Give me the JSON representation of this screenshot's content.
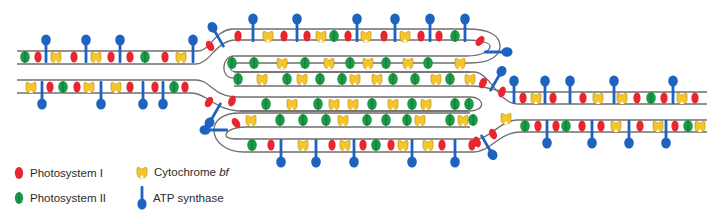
{
  "figure": {
    "colors": {
      "membrane": "#6f6f6f",
      "photosystem_i": "#e8262f",
      "photosystem_ii": "#1c9a47",
      "cytochrome_bf": "#f5c52c",
      "atp_synthase": "#1e63c0"
    }
  },
  "legend": {
    "items": [
      {
        "key": "photosystem_i",
        "icon": "red-oval-icon",
        "label": "Photosystem I",
        "label_italic": ""
      },
      {
        "key": "cytochrome_bf",
        "icon": "yellow-cup-icon",
        "label": "Cytochrome ",
        "label_italic": "bf"
      },
      {
        "key": "photosystem_ii",
        "icon": "green-oval-icon",
        "label": "Photosystem II",
        "label_italic": ""
      },
      {
        "key": "atp_synthase",
        "icon": "blue-lollipop-icon",
        "label": "ATP synthase",
        "label_italic": ""
      }
    ]
  },
  "proteins": {
    "left_top_band": [
      {
        "type": "PSII",
        "x": 25,
        "y": 57
      },
      {
        "type": "PSI",
        "x": 38,
        "y": 57
      },
      {
        "type": "ATP",
        "x": 46,
        "y": 57,
        "dir": "up"
      },
      {
        "type": "CYT",
        "x": 56,
        "y": 57
      },
      {
        "type": "PSI",
        "x": 74,
        "y": 57
      },
      {
        "type": "ATP",
        "x": 86,
        "y": 57,
        "dir": "up"
      },
      {
        "type": "CYT",
        "x": 96,
        "y": 57
      },
      {
        "type": "PSI",
        "x": 111,
        "y": 57
      },
      {
        "type": "ATP",
        "x": 120,
        "y": 57,
        "dir": "up"
      },
      {
        "type": "PSI",
        "x": 130,
        "y": 57
      },
      {
        "type": "PSII",
        "x": 145,
        "y": 57
      },
      {
        "type": "PSI",
        "x": 165,
        "y": 57
      },
      {
        "type": "CYT",
        "x": 181,
        "y": 57
      },
      {
        "type": "ATP",
        "x": 193,
        "y": 57,
        "dir": "up"
      }
    ],
    "left_bottom_band": [
      {
        "type": "CYT",
        "x": 31,
        "y": 87
      },
      {
        "type": "ATP",
        "x": 42,
        "y": 87,
        "dir": "down"
      },
      {
        "type": "PSI",
        "x": 50,
        "y": 87
      },
      {
        "type": "PSII",
        "x": 63,
        "y": 87
      },
      {
        "type": "PSI",
        "x": 77,
        "y": 87
      },
      {
        "type": "CYT",
        "x": 89,
        "y": 87
      },
      {
        "type": "ATP",
        "x": 101,
        "y": 87,
        "dir": "down"
      },
      {
        "type": "CYT",
        "x": 116,
        "y": 87
      },
      {
        "type": "PSI",
        "x": 130,
        "y": 87
      },
      {
        "type": "ATP",
        "x": 143,
        "y": 87,
        "dir": "down"
      },
      {
        "type": "PSI",
        "x": 155,
        "y": 87
      },
      {
        "type": "ATP",
        "x": 163,
        "y": 87,
        "dir": "down"
      },
      {
        "type": "PSII",
        "x": 174,
        "y": 87
      },
      {
        "type": "PSI",
        "x": 185,
        "y": 87
      }
    ],
    "grana_top_outer": [
      {
        "type": "PSI",
        "x": 238,
        "y": 36
      },
      {
        "type": "ATP",
        "x": 253,
        "y": 36,
        "dir": "up"
      },
      {
        "type": "CYT",
        "x": 268,
        "y": 36
      },
      {
        "type": "PSI",
        "x": 284,
        "y": 36
      },
      {
        "type": "ATP",
        "x": 297,
        "y": 36,
        "dir": "up"
      },
      {
        "type": "PSI",
        "x": 307,
        "y": 36
      },
      {
        "type": "CYT",
        "x": 321,
        "y": 36
      },
      {
        "type": "PSII",
        "x": 334,
        "y": 36
      },
      {
        "type": "PSI",
        "x": 348,
        "y": 36
      },
      {
        "type": "ATP",
        "x": 357,
        "y": 36,
        "dir": "up"
      },
      {
        "type": "CYT",
        "x": 366,
        "y": 36
      },
      {
        "type": "PSI",
        "x": 384,
        "y": 36
      },
      {
        "type": "ATP",
        "x": 395,
        "y": 36,
        "dir": "up"
      },
      {
        "type": "CYT",
        "x": 405,
        "y": 36
      },
      {
        "type": "PSI",
        "x": 421,
        "y": 36
      },
      {
        "type": "ATP",
        "x": 430,
        "y": 36,
        "dir": "up"
      },
      {
        "type": "PSI",
        "x": 439,
        "y": 36
      },
      {
        "type": "PSII",
        "x": 455,
        "y": 36
      },
      {
        "type": "ATP",
        "x": 465,
        "y": 36,
        "dir": "up"
      }
    ],
    "grana_row1": [
      {
        "type": "PSII",
        "x": 232,
        "y": 63
      },
      {
        "type": "PSII",
        "x": 254,
        "y": 63
      },
      {
        "type": "CYT",
        "x": 282,
        "y": 63
      },
      {
        "type": "PSII",
        "x": 305,
        "y": 63
      },
      {
        "type": "CYT",
        "x": 329,
        "y": 63
      },
      {
        "type": "PSII",
        "x": 350,
        "y": 63
      },
      {
        "type": "CYT",
        "x": 368,
        "y": 63
      },
      {
        "type": "PSII",
        "x": 386,
        "y": 63
      },
      {
        "type": "CYT",
        "x": 408,
        "y": 63
      },
      {
        "type": "PSII",
        "x": 428,
        "y": 63
      },
      {
        "type": "CYT",
        "x": 460,
        "y": 63
      }
    ],
    "grana_row2": [
      {
        "type": "PSII",
        "x": 238,
        "y": 79
      },
      {
        "type": "CYT",
        "x": 262,
        "y": 79
      },
      {
        "type": "PSII",
        "x": 287,
        "y": 79
      },
      {
        "type": "CYT",
        "x": 302,
        "y": 79
      },
      {
        "type": "PSII",
        "x": 320,
        "y": 79
      },
      {
        "type": "PSII",
        "x": 342,
        "y": 79
      },
      {
        "type": "CYT",
        "x": 355,
        "y": 79
      },
      {
        "type": "CYT",
        "x": 377,
        "y": 79
      },
      {
        "type": "PSII",
        "x": 393,
        "y": 79
      },
      {
        "type": "PSII",
        "x": 415,
        "y": 79
      },
      {
        "type": "CYT",
        "x": 436,
        "y": 79
      },
      {
        "type": "PSII",
        "x": 450,
        "y": 79
      },
      {
        "type": "CYT",
        "x": 470,
        "y": 79
      }
    ],
    "grana_row3": [
      {
        "type": "PSII",
        "x": 266,
        "y": 104
      },
      {
        "type": "CYT",
        "x": 292,
        "y": 104
      },
      {
        "type": "PSII",
        "x": 318,
        "y": 104
      },
      {
        "type": "CYT",
        "x": 334,
        "y": 104
      },
      {
        "type": "CYT",
        "x": 353,
        "y": 104
      },
      {
        "type": "PSII",
        "x": 372,
        "y": 104
      },
      {
        "type": "CYT",
        "x": 393,
        "y": 104
      },
      {
        "type": "PSII",
        "x": 412,
        "y": 104
      },
      {
        "type": "CYT",
        "x": 426,
        "y": 104
      },
      {
        "type": "PSII",
        "x": 455,
        "y": 104
      },
      {
        "type": "PSII",
        "x": 469,
        "y": 104
      }
    ],
    "grana_row4": [
      {
        "type": "CYT",
        "x": 251,
        "y": 120
      },
      {
        "type": "PSII",
        "x": 280,
        "y": 120
      },
      {
        "type": "PSII",
        "x": 303,
        "y": 120
      },
      {
        "type": "PSII",
        "x": 326,
        "y": 120
      },
      {
        "type": "CYT",
        "x": 343,
        "y": 120
      },
      {
        "type": "PSII",
        "x": 367,
        "y": 120
      },
      {
        "type": "PSII",
        "x": 386,
        "y": 120
      },
      {
        "type": "PSII",
        "x": 407,
        "y": 120
      },
      {
        "type": "CYT",
        "x": 420,
        "y": 120
      },
      {
        "type": "PSII",
        "x": 450,
        "y": 120
      },
      {
        "type": "CYT",
        "x": 463,
        "y": 120
      },
      {
        "type": "PSII",
        "x": 473,
        "y": 120
      }
    ],
    "grana_bottom_outer": [
      {
        "type": "PSII",
        "x": 252,
        "y": 145
      },
      {
        "type": "PSI",
        "x": 271,
        "y": 145
      },
      {
        "type": "ATP",
        "x": 281,
        "y": 145,
        "dir": "down"
      },
      {
        "type": "CYT",
        "x": 303,
        "y": 145
      },
      {
        "type": "ATP",
        "x": 316,
        "y": 145,
        "dir": "down"
      },
      {
        "type": "PSI",
        "x": 332,
        "y": 145
      },
      {
        "type": "CYT",
        "x": 345,
        "y": 145
      },
      {
        "type": "ATP",
        "x": 354,
        "y": 145,
        "dir": "down"
      },
      {
        "type": "PSI",
        "x": 363,
        "y": 145
      },
      {
        "type": "PSII",
        "x": 376,
        "y": 145
      },
      {
        "type": "PSI",
        "x": 391,
        "y": 145
      },
      {
        "type": "CYT",
        "x": 403,
        "y": 145
      },
      {
        "type": "ATP",
        "x": 412,
        "y": 145,
        "dir": "down"
      },
      {
        "type": "CYT",
        "x": 428,
        "y": 145
      },
      {
        "type": "PSI",
        "x": 442,
        "y": 145
      },
      {
        "type": "ATP",
        "x": 455,
        "y": 145,
        "dir": "down"
      },
      {
        "type": "PSI",
        "x": 472,
        "y": 145
      }
    ],
    "right_top_band": [
      {
        "type": "ATP",
        "x": 514,
        "y": 98,
        "dir": "up"
      },
      {
        "type": "PSI",
        "x": 523,
        "y": 98
      },
      {
        "type": "CYT",
        "x": 536,
        "y": 98
      },
      {
        "type": "ATP",
        "x": 545,
        "y": 98,
        "dir": "up"
      },
      {
        "type": "PSI",
        "x": 553,
        "y": 98
      },
      {
        "type": "ATP",
        "x": 570,
        "y": 98,
        "dir": "up"
      },
      {
        "type": "PSI",
        "x": 583,
        "y": 98
      },
      {
        "type": "CYT",
        "x": 598,
        "y": 98
      },
      {
        "type": "ATP",
        "x": 614,
        "y": 98,
        "dir": "up"
      },
      {
        "type": "CYT",
        "x": 622,
        "y": 98
      },
      {
        "type": "PSI",
        "x": 637,
        "y": 98
      },
      {
        "type": "PSII",
        "x": 651,
        "y": 98
      },
      {
        "type": "PSI",
        "x": 664,
        "y": 98
      },
      {
        "type": "ATP",
        "x": 673,
        "y": 98,
        "dir": "up"
      },
      {
        "type": "CYT",
        "x": 682,
        "y": 98
      },
      {
        "type": "PSI",
        "x": 695,
        "y": 98
      }
    ],
    "right_bottom_band": [
      {
        "type": "PSII",
        "x": 525,
        "y": 126
      },
      {
        "type": "PSI",
        "x": 538,
        "y": 126
      },
      {
        "type": "ATP",
        "x": 547,
        "y": 126,
        "dir": "down"
      },
      {
        "type": "PSI",
        "x": 556,
        "y": 126
      },
      {
        "type": "PSII",
        "x": 566,
        "y": 126
      },
      {
        "type": "PSI",
        "x": 582,
        "y": 126
      },
      {
        "type": "ATP",
        "x": 592,
        "y": 126,
        "dir": "down"
      },
      {
        "type": "PSI",
        "x": 601,
        "y": 126
      },
      {
        "type": "CYT",
        "x": 616,
        "y": 126
      },
      {
        "type": "ATP",
        "x": 629,
        "y": 126,
        "dir": "down"
      },
      {
        "type": "PSI",
        "x": 640,
        "y": 126
      },
      {
        "type": "CYT",
        "x": 658,
        "y": 126
      },
      {
        "type": "ATP",
        "x": 666,
        "y": 126,
        "dir": "down"
      },
      {
        "type": "PSI",
        "x": 675,
        "y": 126
      },
      {
        "type": "PSII",
        "x": 688,
        "y": 126
      },
      {
        "type": "CYT",
        "x": 700,
        "y": 126
      }
    ],
    "connectors": [
      {
        "type": "PSI",
        "x": 210,
        "y": 46,
        "rot": -30
      },
      {
        "type": "ATP",
        "x": 221,
        "y": 42,
        "dir": "up",
        "rot": -30
      },
      {
        "type": "PSI",
        "x": 209,
        "y": 102,
        "rot": 30
      },
      {
        "type": "ATP",
        "x": 218,
        "y": 108,
        "dir": "down",
        "rot": 30
      },
      {
        "type": "PSI",
        "x": 232,
        "y": 101,
        "rot": 20
      },
      {
        "type": "PSI",
        "x": 480,
        "y": 41,
        "rot": 40
      },
      {
        "type": "ATP",
        "x": 490,
        "y": 52,
        "dir": "right"
      },
      {
        "type": "PSI",
        "x": 483,
        "y": 83,
        "rot": 25
      },
      {
        "type": "ATP",
        "x": 493,
        "y": 86,
        "dir": "up",
        "rot": 30
      },
      {
        "type": "PSI",
        "x": 502,
        "y": 92,
        "rot": 20
      },
      {
        "type": "CYT",
        "x": 506,
        "y": 118
      },
      {
        "type": "PSI",
        "x": 493,
        "y": 134,
        "rot": -25
      },
      {
        "type": "ATP",
        "x": 484,
        "y": 140,
        "dir": "down",
        "rot": -30
      },
      {
        "type": "PSI",
        "x": 477,
        "y": 142,
        "rot": -20
      },
      {
        "type": "ATP",
        "x": 222,
        "y": 130,
        "dir": "left"
      },
      {
        "type": "PSI",
        "x": 236,
        "y": 123,
        "rot": -35
      }
    ]
  }
}
